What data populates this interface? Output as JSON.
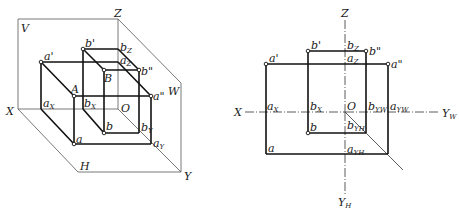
{
  "figure_left": {
    "title": "Three-plane projection system (pictorial)",
    "planes": {
      "V": "V",
      "H": "H",
      "W": "W"
    },
    "axes": {
      "X": "X",
      "Y": "Y",
      "Z": "Z",
      "origin": "O"
    },
    "points": {
      "A": "A",
      "B": "B",
      "a_prime": "a'",
      "b_prime": "b'",
      "a_double": "a\"",
      "b_double": "b\"",
      "a": "a",
      "b": "b"
    },
    "axis_points": {
      "aX": {
        "base": "a",
        "sub": "X"
      },
      "bX": {
        "base": "b",
        "sub": "X"
      },
      "aZ": {
        "base": "a",
        "sub": "Z"
      },
      "bZ": {
        "base": "b",
        "sub": "Z"
      },
      "aY": {
        "base": "a",
        "sub": "Y"
      },
      "bY": {
        "base": "b",
        "sub": "Y"
      }
    }
  },
  "figure_right": {
    "title": "Orthographic projection (unfolded)",
    "axes": {
      "X": "X",
      "Z": "Z",
      "YW": {
        "base": "Y",
        "sub": "W"
      },
      "YH": {
        "base": "Y",
        "sub": "H"
      },
      "origin": "O"
    },
    "points": {
      "a_prime": "a'",
      "b_prime": "b'",
      "a_double": "a\"",
      "b_double": "b\"",
      "a": "a",
      "b": "b"
    },
    "axis_points": {
      "aX": {
        "base": "a",
        "sub": "X"
      },
      "bX": {
        "base": "b",
        "sub": "X"
      },
      "aZ": {
        "base": "a",
        "sub": "Z"
      },
      "bZ": {
        "base": "b",
        "sub": "Z"
      },
      "aYW": {
        "base": "a",
        "sub": "YW"
      },
      "bYW": {
        "base": "b",
        "sub": "YW"
      },
      "aYH": {
        "base": "a",
        "sub": "YH"
      },
      "bYH": {
        "base": "b",
        "sub": "YH"
      }
    }
  }
}
